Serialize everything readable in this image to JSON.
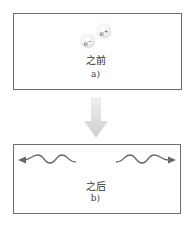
{
  "panel_a": {
    "particles": [
      {
        "name": "electron",
        "label": "e",
        "charge": "−"
      },
      {
        "name": "positron",
        "label": "e",
        "charge": "+"
      }
    ],
    "caption": "之前",
    "sublabel": "a)"
  },
  "transition_arrow": {
    "direction": "down",
    "color": "#d6d6d6"
  },
  "panel_b": {
    "photons": [
      {
        "name": "photon-left",
        "direction": "left"
      },
      {
        "name": "photon-right",
        "direction": "right"
      }
    ],
    "caption": "之后",
    "sublabel": "b)"
  },
  "colors": {
    "border": "#6e6e6e",
    "wave": "#666666",
    "arrow": "#d6d6d6"
  }
}
